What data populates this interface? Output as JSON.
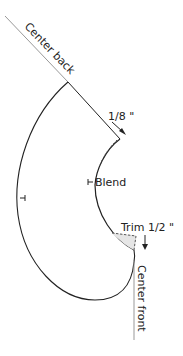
{
  "diagram": {
    "type": "sewing-pattern-facing",
    "labels": {
      "center_back": "Center back",
      "shoulder_adjust": "1/8 \"",
      "blend": "Blend",
      "trim": "Trim 1/2 \"",
      "center_front": "Center front"
    },
    "colors": {
      "outline": "#222222",
      "grainline": "#999999",
      "trim_fill": "#e6e6e6",
      "dashed": "#444444"
    }
  }
}
